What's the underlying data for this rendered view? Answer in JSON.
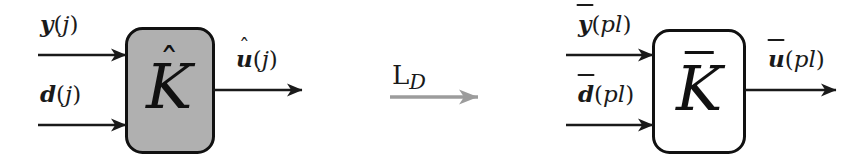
{
  "figure": {
    "background_color": "#ffffff",
    "ink_color": "#1a1a1a",
    "block_fill_gray": "#b0b0b0",
    "block_fill_white": "#ffffff",
    "gray_arrow_color": "#9c9c9c"
  },
  "left_system": {
    "block": {
      "label_base": "K",
      "accent": "hat",
      "accent_glyph": "ˆ",
      "fill": "#b0b0b0",
      "stroke": "#111111"
    },
    "inputs": [
      {
        "name": "measurement",
        "variable": "y",
        "accent": "none",
        "open_paren": "(",
        "argument": "j",
        "close_paren": ")",
        "text": "y(j)"
      },
      {
        "name": "disturbance",
        "variable": "d",
        "accent": "none",
        "open_paren": "(",
        "argument": "j",
        "close_paren": ")",
        "text": "d(j)"
      }
    ],
    "outputs": [
      {
        "name": "control",
        "variable": "u",
        "accent": "hat",
        "accent_glyph": "ˆ",
        "open_paren": "(",
        "argument": "j",
        "close_paren": ")",
        "text": "û(j)"
      }
    ]
  },
  "operator": {
    "symbol": "ᵃ",
    "blackboard_letter": "L",
    "subscript": "D",
    "text": "ℒ_D",
    "arrow_color": "#9c9c9c",
    "direction": "right"
  },
  "right_system": {
    "block": {
      "label_base": "K",
      "accent": "bar",
      "fill": "#ffffff",
      "stroke": "#111111"
    },
    "inputs": [
      {
        "name": "measurement",
        "variable": "y",
        "accent": "bar",
        "open_paren": "(",
        "argument": "pl",
        "close_paren": ")",
        "text": "ȳ(pl)"
      },
      {
        "name": "disturbance",
        "variable": "d",
        "accent": "bar",
        "open_paren": "(",
        "argument": "pl",
        "close_paren": ")",
        "text": "d̄(pl)"
      }
    ],
    "outputs": [
      {
        "name": "control",
        "variable": "u",
        "accent": "bar",
        "open_paren": "(",
        "argument": "pl",
        "close_paren": ")",
        "text": "ū(pl)"
      }
    ]
  }
}
